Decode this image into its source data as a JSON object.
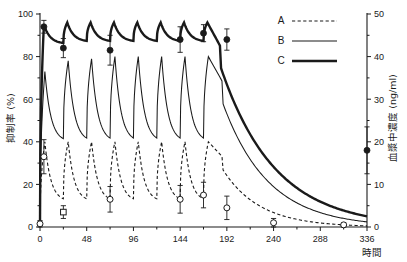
{
  "chart_data": {
    "type": "line",
    "title": "",
    "xlabel": "時間",
    "ylabel": "抑制率 (%)",
    "y2label": "血漿中濃度 (ng/ml)",
    "xlim": [
      0,
      336
    ],
    "ylim": [
      0,
      100
    ],
    "y2lim": [
      0,
      50
    ],
    "xticks": [
      0,
      48,
      96,
      144,
      192,
      240,
      288,
      336
    ],
    "xtick_labels": [
      "0",
      "48",
      "96",
      "144",
      "192",
      "240",
      "288",
      "336"
    ],
    "xminorticks": [
      24,
      72,
      120,
      168,
      216,
      264,
      312
    ],
    "yticks": [
      0,
      20,
      40,
      60,
      80,
      100
    ],
    "ytick_labels": [
      "0",
      "20",
      "40",
      "60",
      "80",
      "100"
    ],
    "yminorticks": [
      10,
      30,
      50,
      70,
      90
    ],
    "y2ticks": [
      0,
      10,
      20,
      30,
      40,
      50
    ],
    "y2tick_labels": [
      "0",
      "10",
      "20",
      "30",
      "40",
      "50"
    ],
    "y2minorticks": [
      5,
      15,
      25,
      35,
      45
    ],
    "grid": false,
    "legend_position": "upper-right",
    "legend": [
      {
        "label": "A",
        "style": "dashed",
        "width": 1.1
      },
      {
        "label": "B",
        "style": "solid",
        "width": 1.05
      },
      {
        "label": "C",
        "style": "solid-thick",
        "width": 2.4
      }
    ],
    "series": [
      {
        "name": "A",
        "style": "dashed",
        "marker": "open-circle",
        "dose_interval_h": 24,
        "peaks_pct": [
          40,
          40,
          40,
          40,
          40,
          40,
          40,
          40
        ],
        "troughs_pct": [
          12,
          12,
          12,
          12,
          12,
          12,
          12
        ],
        "peak_time_offset_h": 5,
        "terminal_decay_from_h": 192,
        "points": [
          {
            "x": 0,
            "y": 1.5,
            "err": 1.5,
            "marker": "open-circle"
          },
          {
            "x": 4,
            "y": 33,
            "err": 8,
            "marker": "open-circle"
          },
          {
            "x": 24,
            "y": 7,
            "err": 3,
            "marker": "open-square"
          },
          {
            "x": 72,
            "y": 13,
            "err": 6,
            "marker": "open-circle"
          },
          {
            "x": 144,
            "y": 13,
            "err": 6.5,
            "marker": "open-circle"
          },
          {
            "x": 168,
            "y": 15,
            "err": 6,
            "marker": "open-circle"
          },
          {
            "x": 192,
            "y": 9,
            "err": 5.5,
            "marker": "open-circle"
          },
          {
            "x": 240,
            "y": 2,
            "err": 2,
            "marker": "open-circle"
          },
          {
            "x": 312,
            "y": 1,
            "err": 1,
            "marker": "open-circle"
          }
        ]
      },
      {
        "name": "B",
        "style": "solid",
        "marker": "none",
        "dose_interval_h": 24,
        "peaks_pct": [
          73,
          78,
          79,
          80,
          80,
          80,
          80,
          80
        ],
        "troughs_pct": [
          40,
          40,
          40,
          40,
          40,
          40,
          40
        ],
        "peak_time_offset_h": 5,
        "terminal_decay_from_h": 192,
        "points": []
      },
      {
        "name": "C",
        "style": "solid-thick",
        "marker": "filled-circle",
        "dose_interval_h": 24,
        "peaks_pct": [
          95,
          96,
          96,
          96,
          96,
          96,
          96,
          96
        ],
        "troughs_pct": [
          86,
          87,
          87,
          87,
          87,
          87,
          87
        ],
        "peak_time_offset_h": 4,
        "terminal_decay_from_h": 192,
        "points": [
          {
            "x": 4,
            "y": 94,
            "err": 3,
            "marker": "filled-circle"
          },
          {
            "x": 24,
            "y": 84,
            "err": 4.5,
            "marker": "filled-circle"
          },
          {
            "x": 72,
            "y": 83,
            "err": 7,
            "marker": "filled-circle"
          },
          {
            "x": 144,
            "y": 88,
            "err": 6,
            "marker": "filled-circle"
          },
          {
            "x": 168,
            "y": 91,
            "err": 4,
            "marker": "filled-circle"
          },
          {
            "x": 192,
            "y": 88,
            "err": 5,
            "marker": "filled-circle"
          }
        ]
      },
      {
        "name": "plasma-concentration-point",
        "axis": "right",
        "style": "none",
        "marker": "filled-circle",
        "points": [
          {
            "x": 336,
            "y2": 18,
            "err2": 5.5,
            "marker": "filled-circle"
          }
        ]
      }
    ]
  },
  "axes": {
    "left_title": "抑制率 (%)",
    "right_title": "血漿中濃度 (ng/ml)",
    "x_title": "時間"
  },
  "legend": {
    "a_label": "A",
    "b_label": "B",
    "c_label": "C"
  }
}
